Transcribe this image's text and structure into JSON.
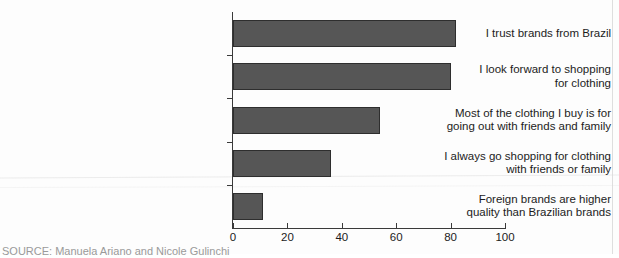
{
  "chart_data": {
    "type": "bar",
    "orientation": "horizontal",
    "title": "",
    "xlabel": "",
    "ylabel": "",
    "xlim": [
      0,
      100
    ],
    "xticks": [
      0,
      20,
      40,
      60,
      80,
      100
    ],
    "grid": false,
    "legend": false,
    "bar_color": "#565656",
    "bar_edge_color": "#2e2e2e",
    "categories": [
      "I trust brands from Brazil",
      "I look forward to shopping\nfor clothing",
      "Most of the clothing I buy is for\ngoing out with friends and family",
      "I always go shopping for clothing\nwith friends or family",
      "Foreign brands are higher\nquality than Brazilian brands"
    ],
    "values": [
      82,
      80,
      54,
      36,
      11
    ]
  },
  "caption": {
    "source_note": "SOURCE: Manuela Ariano and Nicole Gulinchi"
  }
}
